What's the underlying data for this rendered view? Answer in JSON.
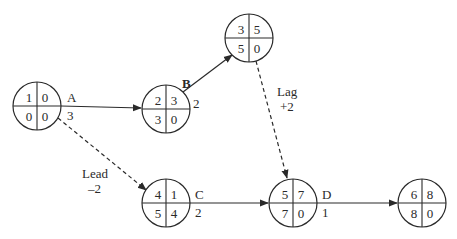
{
  "diagram": {
    "type": "activity-on-node precedence network with lead and lag",
    "nodes": [
      {
        "id": "start",
        "activity": "A",
        "duration": "3",
        "tl": "1",
        "tr": "0",
        "bl": "0",
        "br": "0",
        "cx": 37,
        "cy": 106
      },
      {
        "id": "b_node",
        "activity": "B",
        "duration": "2",
        "tl": "2",
        "tr": "3",
        "bl": "3",
        "br": "0",
        "cx": 166,
        "cy": 109
      },
      {
        "id": "top_node",
        "activity": "",
        "duration": "",
        "tl": "3",
        "tr": "5",
        "bl": "5",
        "br": "0",
        "cx": 249,
        "cy": 38
      },
      {
        "id": "c_node",
        "activity": "C",
        "duration": "2",
        "tl": "4",
        "tr": "1",
        "bl": "5",
        "br": "4",
        "cx": 166,
        "cy": 203
      },
      {
        "id": "d_node",
        "activity": "D",
        "duration": "1",
        "tl": "5",
        "tr": "7",
        "bl": "7",
        "br": "0",
        "cx": 293,
        "cy": 203
      },
      {
        "id": "end_node",
        "activity": "",
        "duration": "",
        "tl": "6",
        "tr": "8",
        "bl": "8",
        "br": "0",
        "cx": 422,
        "cy": 203
      }
    ],
    "edges": [
      {
        "from": "start",
        "to": "b_node",
        "style": "solid",
        "label": "A"
      },
      {
        "from": "b_node",
        "to": "top_node",
        "style": "solid",
        "label": "B"
      },
      {
        "from": "top_node",
        "to": "d_node",
        "style": "dashed",
        "label": "Lag +2"
      },
      {
        "from": "start",
        "to": "c_node",
        "style": "dashed",
        "label": "Lead −2"
      },
      {
        "from": "c_node",
        "to": "d_node",
        "style": "solid",
        "label": "C"
      },
      {
        "from": "d_node",
        "to": "end_node",
        "style": "solid",
        "label": "D"
      }
    ],
    "annotations": {
      "lag_label": "Lag",
      "lag_value": "+2",
      "lead_label": "Lead",
      "lead_value": "–2"
    },
    "colors": {
      "line": "#2a2a2a",
      "background": "#ffffff"
    }
  }
}
